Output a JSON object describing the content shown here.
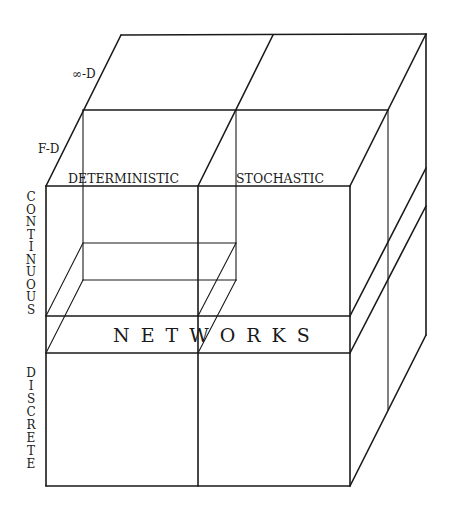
{
  "diagram": {
    "type": "3d-cube-classification",
    "depth_labels": {
      "infinite": "∞-D",
      "finite": "F-D"
    },
    "column_labels": {
      "left": "DETERMINISTIC",
      "right": "STOCHASTIC"
    },
    "row_labels": {
      "top": "CONTINUOUS",
      "top_letters": [
        "C",
        "O",
        "N",
        "T",
        "I",
        "N",
        "U",
        "O",
        "U",
        "S"
      ],
      "middle": "NETWORKS",
      "bottom": "DISCRETE",
      "bottom_letters": [
        "D",
        "I",
        "S",
        "C",
        "R",
        "E",
        "T",
        "E"
      ]
    },
    "colors": {
      "line": "#1a1a1a",
      "background": "#ffffff"
    }
  }
}
